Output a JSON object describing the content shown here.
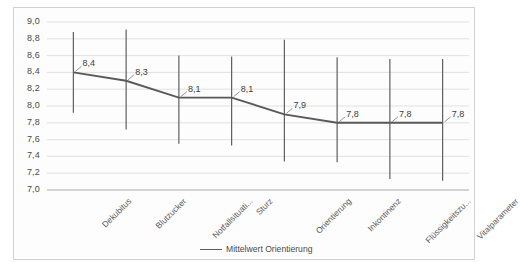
{
  "chart_data": {
    "type": "line",
    "title": "",
    "xlabel": "",
    "ylabel": "",
    "ylim": [
      7.0,
      9.0
    ],
    "ytick_step": 0.2,
    "grid": true,
    "legend_position": "bottom-center",
    "decimal_separator": ",",
    "categories": [
      "Dekubitus",
      "Blutzucker",
      "Notfallsituati...",
      "Sturz",
      "Orientierung",
      "Inkontinenz",
      "Flüssigkeitszu...",
      "Vitalparameter"
    ],
    "series": [
      {
        "name": "Mittelwert Orientierung",
        "color": "#595959",
        "values": [
          8.4,
          8.3,
          8.1,
          8.1,
          7.9,
          7.8,
          7.8,
          7.8
        ],
        "data_labels": [
          "8,4",
          "8,3",
          "8,1",
          "8,1",
          "7,9",
          "7,8",
          "7,8",
          "7,8"
        ],
        "error_bars": [
          {
            "low": 7.92,
            "high": 8.88
          },
          {
            "low": 7.72,
            "high": 8.91
          },
          {
            "low": 7.55,
            "high": 8.6
          },
          {
            "low": 7.53,
            "high": 8.59
          },
          {
            "low": 7.34,
            "high": 8.79
          },
          {
            "low": 7.33,
            "high": 8.58
          },
          {
            "low": 7.13,
            "high": 8.56
          },
          {
            "low": 7.11,
            "high": 8.56
          }
        ]
      }
    ],
    "yticks": [
      "9,0",
      "8,8",
      "8,6",
      "8,4",
      "8,2",
      "8,0",
      "7,8",
      "7,6",
      "7,4",
      "7,2",
      "7,0"
    ],
    "ytick_values": [
      9.0,
      8.8,
      8.6,
      8.4,
      8.2,
      8.0,
      7.8,
      7.6,
      7.4,
      7.2,
      7.0
    ],
    "axis_color": "#b8b8b8",
    "grid_color": "#d9d9d9",
    "plot_background": "#fdfdfd"
  },
  "legend": {
    "entries": [
      {
        "label": "Mittelwert Orientierung",
        "color": "#595959"
      }
    ]
  }
}
